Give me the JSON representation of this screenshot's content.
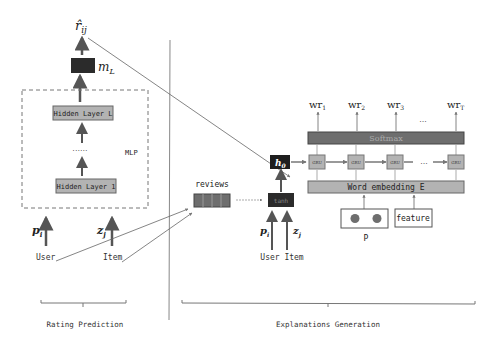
{
  "rating": {
    "output_label": "r̂",
    "output_sub": "ij",
    "m_label": "m",
    "m_sub": "L",
    "hidden_top": "Hidden Layer L",
    "dots": "......",
    "hidden_bottom": "Hidden Layer 1",
    "mlp_label": "MLP",
    "p_label": "p",
    "p_sub": "i",
    "z_label": "z",
    "z_sub": "j",
    "user_label": "User",
    "item_label": "Item",
    "section_label": "Rating Prediction"
  },
  "explanation": {
    "reviews_label": "reviews",
    "tanh_label": "tanh",
    "h0_label": "h",
    "h0_sub": "0",
    "p_label": "p",
    "p_sub": "i",
    "z_label": "z",
    "z_sub": "j",
    "user_item_label": "User Item",
    "gru_label": "GRU",
    "gru_dots": "...",
    "softmax_label": "Softmax",
    "embedding_label": "Word embedding E",
    "p_box_label": "P",
    "feature_label": "feature",
    "outputs": [
      {
        "base": "wr",
        "sub": "1"
      },
      {
        "base": "wr",
        "sub": "2"
      },
      {
        "base": "wr",
        "sub": "3"
      },
      {
        "base": "wr",
        "sub": "T"
      }
    ],
    "output_dots": "...",
    "section_label": "Explanations Generation"
  },
  "colors": {
    "dark_box": "#2b2b2b",
    "gray_box": "#b3b3b3",
    "softmax": "#6e6e6e",
    "line": "#555555"
  }
}
